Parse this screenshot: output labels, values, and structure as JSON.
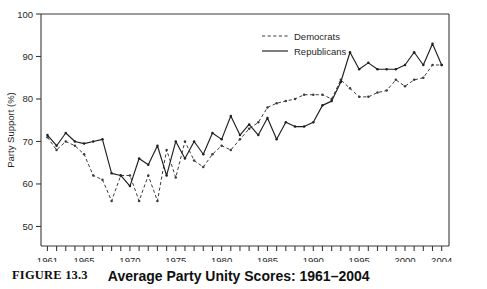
{
  "figure": {
    "number_label": "FIGURE 13.3",
    "caption_title": "Average Party Unity Scores: 1961–2004"
  },
  "colors": {
    "ink": "#1a1a1a",
    "frame": "#3a3a3a",
    "democrats_line": "#3c3c3c",
    "republicans_line": "#1f1f1f",
    "background": "#ffffff"
  },
  "chart_data": {
    "type": "line",
    "title": "Average Party Unity Scores: 1961–2004",
    "xlabel": "",
    "ylabel": "Party Support (%)",
    "xlim": [
      1960,
      2005
    ],
    "ylim": [
      45,
      100
    ],
    "yticks": [
      50,
      60,
      70,
      80,
      90,
      100
    ],
    "ytick_labels": [
      "50",
      "60",
      "70",
      "80",
      "90",
      "100"
    ],
    "xtick_labels": [
      "1961",
      "1965",
      "1970",
      "1975",
      "1980",
      "1985",
      "1990",
      "1995",
      "2000",
      "2004"
    ],
    "xtick_values": [
      1961,
      1965,
      1970,
      1975,
      1980,
      1985,
      1990,
      1995,
      2000,
      2004
    ],
    "minor_xticks_every": 1,
    "grid": false,
    "legend_position": "top-center",
    "x": [
      1961,
      1962,
      1963,
      1964,
      1965,
      1966,
      1967,
      1968,
      1969,
      1970,
      1971,
      1972,
      1973,
      1974,
      1975,
      1976,
      1977,
      1978,
      1979,
      1980,
      1981,
      1982,
      1983,
      1984,
      1985,
      1986,
      1987,
      1988,
      1989,
      1990,
      1991,
      1992,
      1993,
      1994,
      1995,
      1996,
      1997,
      1998,
      1999,
      2000,
      2001,
      2002,
      2003,
      2004
    ],
    "series": [
      {
        "name": "Democrats",
        "style": "dashed",
        "marker": "dot",
        "values": [
          71,
          68,
          70,
          69,
          67,
          62,
          61,
          56,
          62,
          62,
          56,
          62,
          56,
          68,
          61.5,
          70,
          65.5,
          64,
          67,
          69,
          68,
          70.5,
          73,
          74.5,
          78,
          79,
          79.5,
          80,
          81,
          81,
          81,
          80,
          84.5,
          82.5,
          80.5,
          80.5,
          81.5,
          82,
          84.5,
          83,
          84.5,
          85,
          88,
          88
        ]
      },
      {
        "name": "Republicans",
        "style": "solid",
        "marker": "dot",
        "values": [
          71.5,
          69,
          72,
          70,
          69.5,
          70,
          70.5,
          62.5,
          62,
          59.5,
          66,
          64.5,
          69,
          62,
          70,
          66,
          70,
          67,
          72,
          70.5,
          76,
          71.5,
          74,
          71.5,
          75.5,
          70.5,
          74.5,
          73.5,
          73.5,
          74.5,
          78.5,
          79.5,
          84,
          91,
          87,
          88.5,
          87,
          87,
          87,
          88,
          91,
          88,
          93,
          88
        ]
      }
    ]
  },
  "legend": {
    "entries": [
      {
        "label": "Democrats",
        "style": "dashed"
      },
      {
        "label": "Republicans",
        "style": "solid"
      }
    ]
  }
}
